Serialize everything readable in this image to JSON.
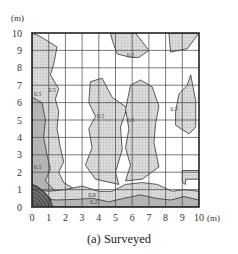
{
  "figure": {
    "caption": "(a) Surveyed",
    "y_unit": "(m)",
    "x_unit": "(m)"
  },
  "colors": {
    "fill_light": "#d6d6d6",
    "fill_mid": "#b8b8b8",
    "fill_dark": "#8a8a8a",
    "grid": "#444444",
    "contour": "#333333",
    "frame": "#222222"
  },
  "chart_data": {
    "type": "heatmap",
    "subtype": "contour",
    "title": "(a) Surveyed",
    "xlabel": "(m)",
    "ylabel": "(m)",
    "xlim": [
      0,
      10
    ],
    "ylim": [
      0,
      10
    ],
    "x_ticks": [
      "0",
      "1",
      "2",
      "3",
      "4",
      "5",
      "6",
      "7",
      "8",
      "9",
      "10"
    ],
    "y_ticks": [
      "0",
      "1",
      "2",
      "3",
      "4",
      "5",
      "6",
      "7",
      "8",
      "9",
      "10"
    ],
    "grid": true,
    "contour_labels": [
      {
        "text": "0.5",
        "x": 0.35,
        "y": 6.4
      },
      {
        "text": "0.5",
        "x": 1.2,
        "y": 6.6
      },
      {
        "text": "0.5",
        "x": 0.35,
        "y": 2.2
      },
      {
        "text": "0.5",
        "x": 4.1,
        "y": 5.1
      },
      {
        "text": "0.5",
        "x": 5.9,
        "y": 8.6
      },
      {
        "text": "0.5",
        "x": 5.9,
        "y": 4.9
      },
      {
        "text": "0.5",
        "x": 8.5,
        "y": 5.5
      },
      {
        "text": "0.6",
        "x": 3.6,
        "y": 0.55
      },
      {
        "text": "0.2",
        "x": 3.7,
        "y": 0.15
      },
      {
        "text": "1.0",
        "x": 0.2,
        "y": 0.0
      }
    ],
    "regions": [
      {
        "name": "left-strip",
        "level": ">0.5",
        "points": [
          [
            0,
            10
          ],
          [
            0.5,
            9.8
          ],
          [
            1.5,
            9.2
          ],
          [
            1.3,
            8.2
          ],
          [
            1.1,
            7.6
          ],
          [
            1.6,
            6.8
          ],
          [
            1.4,
            6.2
          ],
          [
            1.6,
            5.5
          ],
          [
            1.5,
            4.5
          ],
          [
            1.7,
            3.4
          ],
          [
            1.9,
            2.6
          ],
          [
            1.6,
            2.0
          ],
          [
            1.9,
            1.4
          ],
          [
            2.6,
            1.0
          ],
          [
            4.0,
            0.9
          ],
          [
            4.0,
            0.3
          ],
          [
            0,
            0.3
          ]
        ]
      },
      {
        "name": "left-inner",
        "level": ">0.6",
        "points": [
          [
            0,
            6.3
          ],
          [
            0.6,
            6.0
          ],
          [
            0.8,
            5.0
          ],
          [
            0.7,
            4.0
          ],
          [
            0.9,
            3.0
          ],
          [
            1.1,
            2.2
          ],
          [
            0.8,
            1.5
          ],
          [
            1.3,
            1.0
          ],
          [
            2.0,
            0.7
          ],
          [
            2.8,
            0.6
          ],
          [
            2.6,
            0.3
          ],
          [
            0,
            0.3
          ]
        ]
      },
      {
        "name": "top-center",
        "level": ">0.5",
        "points": [
          [
            4.7,
            10
          ],
          [
            6.2,
            10
          ],
          [
            7.0,
            9.0
          ],
          [
            6.4,
            8.6
          ],
          [
            5.9,
            8.6
          ],
          [
            5.1,
            8.8
          ],
          [
            4.8,
            9.6
          ]
        ]
      },
      {
        "name": "top-right",
        "level": ">0.5",
        "points": [
          [
            8.2,
            10
          ],
          [
            10,
            10
          ],
          [
            9.3,
            9.1
          ],
          [
            8.3,
            8.9
          ]
        ]
      },
      {
        "name": "center-left",
        "level": ">0.5",
        "points": [
          [
            3.5,
            7.2
          ],
          [
            4.2,
            7.4
          ],
          [
            4.8,
            6.3
          ],
          [
            5.7,
            5.7
          ],
          [
            5.3,
            4.6
          ],
          [
            5.4,
            3.3
          ],
          [
            5.0,
            2.0
          ],
          [
            5.2,
            1.3
          ],
          [
            3.8,
            1.6
          ],
          [
            3.2,
            2.4
          ],
          [
            3.6,
            3.4
          ],
          [
            3.4,
            4.5
          ],
          [
            3.8,
            5.2
          ],
          [
            3.4,
            6.0
          ]
        ]
      },
      {
        "name": "center-right",
        "level": ">0.5",
        "points": [
          [
            5.9,
            7.0
          ],
          [
            6.5,
            7.3
          ],
          [
            7.2,
            6.9
          ],
          [
            7.6,
            5.8
          ],
          [
            7.4,
            4.8
          ],
          [
            7.3,
            3.7
          ],
          [
            7.6,
            2.3
          ],
          [
            6.6,
            1.6
          ],
          [
            5.6,
            1.5
          ],
          [
            5.9,
            2.4
          ],
          [
            5.6,
            3.4
          ],
          [
            5.8,
            4.5
          ],
          [
            5.6,
            5.6
          ]
        ]
      },
      {
        "name": "right-tall",
        "level": ">0.5",
        "points": [
          [
            9.5,
            7.6
          ],
          [
            9.8,
            6.1
          ],
          [
            9.8,
            4.6
          ],
          [
            9.4,
            4.2
          ],
          [
            8.6,
            4.7
          ],
          [
            8.6,
            5.5
          ],
          [
            8.8,
            6.5
          ],
          [
            9.3,
            7.0
          ]
        ]
      },
      {
        "name": "right-bump",
        "level": ">0.5",
        "points": [
          [
            9.0,
            2.1
          ],
          [
            10,
            2.1
          ],
          [
            10,
            1.6
          ],
          [
            9.2,
            1.6
          ],
          [
            9.2,
            1.3
          ],
          [
            9.0,
            1.4
          ]
        ]
      },
      {
        "name": "bottom-band",
        "level": ">0.5",
        "points": [
          [
            0,
            0
          ],
          [
            10,
            0
          ],
          [
            10,
            0.9
          ],
          [
            9.1,
            1.0
          ],
          [
            8.4,
            0.9
          ],
          [
            7.5,
            1.3
          ],
          [
            6.6,
            1.4
          ],
          [
            5.6,
            1.3
          ],
          [
            4.8,
            0.9
          ],
          [
            4.0,
            0.9
          ],
          [
            3.0,
            1.2
          ],
          [
            2.0,
            1.0
          ],
          [
            1.0,
            0.9
          ],
          [
            0,
            1.0
          ]
        ]
      },
      {
        "name": "bottom-inner",
        "level": ">0.6",
        "points": [
          [
            0,
            0
          ],
          [
            10,
            0
          ],
          [
            10,
            0.4
          ],
          [
            9.1,
            0.6
          ],
          [
            8.3,
            0.4
          ],
          [
            7.4,
            0.5
          ],
          [
            6.5,
            0.7
          ],
          [
            5.5,
            0.5
          ],
          [
            4.6,
            0.3
          ],
          [
            3.6,
            0.5
          ],
          [
            2.8,
            0.45
          ],
          [
            1.5,
            0.4
          ],
          [
            0,
            0.5
          ]
        ]
      },
      {
        "name": "corner-peak",
        "level": ">1.0",
        "points": [
          [
            0,
            0
          ],
          [
            1.2,
            0
          ],
          [
            1.1,
            0.5
          ],
          [
            0.7,
            0.9
          ],
          [
            0.3,
            1.2
          ],
          [
            0,
            1.3
          ]
        ]
      }
    ]
  }
}
